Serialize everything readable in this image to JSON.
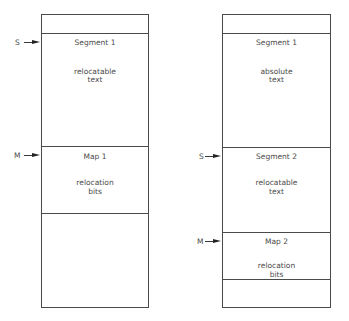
{
  "left_diagram": {
    "sections": [
      {
        "title": "",
        "body": ""
      },
      {
        "title": "Segment 1",
        "body_line1": "relocatable",
        "body_line2": "text"
      },
      {
        "title": "Map 1",
        "body_line1": "relocation",
        "body_line2": "bits"
      },
      {
        "title": "",
        "body": ""
      }
    ],
    "pointers": [
      {
        "label": "S",
        "target": "Segment 1"
      },
      {
        "label": "M",
        "target": "Map 1"
      }
    ]
  },
  "right_diagram": {
    "sections": [
      {
        "title": "",
        "body": ""
      },
      {
        "title": "Segment 1",
        "body_line1": "absolute",
        "body_line2": "text"
      },
      {
        "title": "Segment 2",
        "body_line1": "relocatable",
        "body_line2": "text"
      },
      {
        "title": "Map 2",
        "body_line1": "relocation",
        "body_line2": "bits"
      },
      {
        "title": "",
        "body": ""
      }
    ],
    "pointers": [
      {
        "label": "S",
        "target": "Segment 2"
      },
      {
        "label": "M",
        "target": "Map 2"
      }
    ]
  }
}
